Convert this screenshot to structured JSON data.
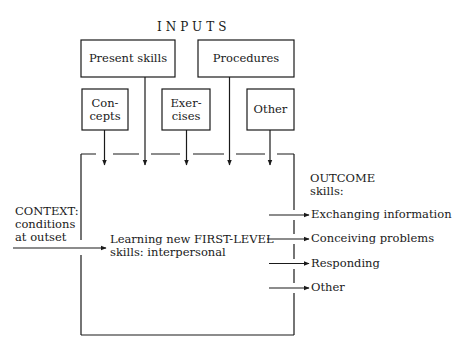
{
  "title": "INPUTS",
  "inputs": {
    "top_row": [
      {
        "label": "Present skills"
      },
      {
        "label": "Procedures"
      }
    ],
    "bottom_row": [
      {
        "label": "Con-\ncepts",
        "line1": "Con-",
        "line2": "cepts"
      },
      {
        "label": "Exer-\ncises",
        "line1": "Exer-",
        "line2": "cises"
      },
      {
        "label": "Other"
      }
    ]
  },
  "context": {
    "line1": "CONTEXT:",
    "line2": "conditions",
    "line3": "at outset"
  },
  "process": {
    "line1": "Learning new FIRST-LEVEL",
    "line2": "skills: interpersonal"
  },
  "outcome": {
    "heading1": "OUTCOME",
    "heading2": "skills:",
    "items": [
      {
        "label": "Exchanging information"
      },
      {
        "label": "Conceiving problems"
      },
      {
        "label": "Responding"
      },
      {
        "label": "Other"
      }
    ]
  },
  "colors": {
    "ink": "#1a1a1a",
    "background": "#ffffff"
  }
}
